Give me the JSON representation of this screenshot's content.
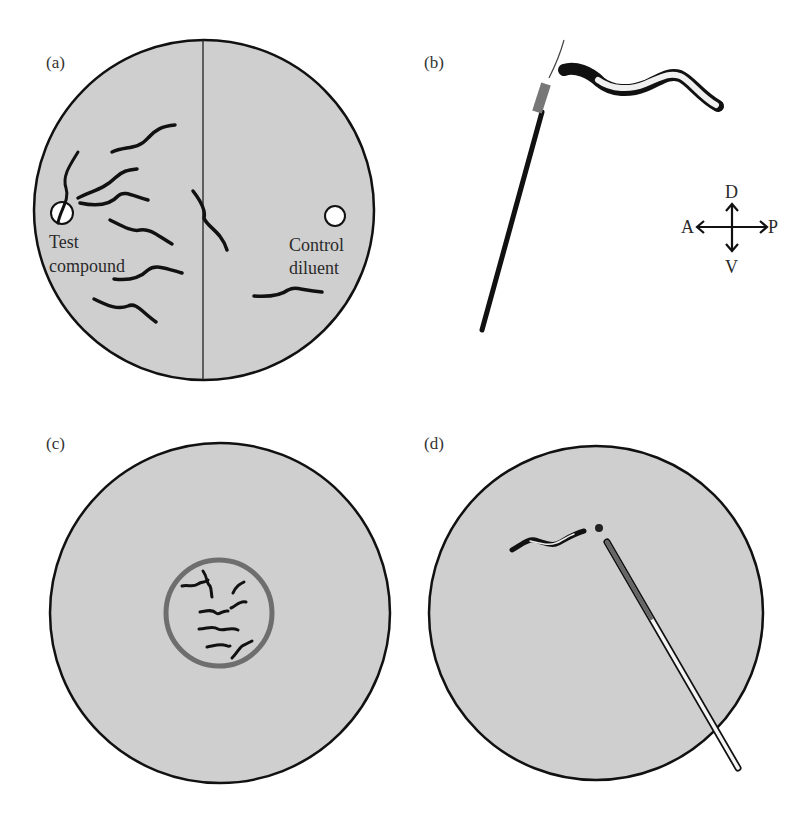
{
  "figure": {
    "panels": [
      {
        "id": "a",
        "label": "(a)",
        "texts": {
          "left_well": "Test",
          "left_well_2": "compound",
          "right_well": "Control",
          "right_well_2": "diluent"
        }
      },
      {
        "id": "b",
        "label": "(b)",
        "axes": {
          "dorsal": "D",
          "ventral": "V",
          "anterior": "A",
          "posterior": "P"
        }
      },
      {
        "id": "c",
        "label": "(c)"
      },
      {
        "id": "d",
        "label": "(d)"
      }
    ],
    "colors": {
      "plate_fill": "#cfcfcf",
      "outline": "#111111",
      "ring": "#6e6e6e",
      "worm": "#111111"
    }
  }
}
